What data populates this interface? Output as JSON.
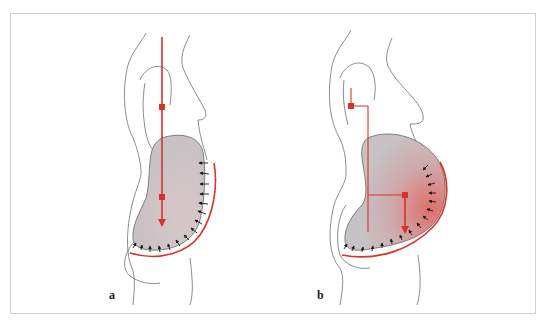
{
  "figure": {
    "panels": [
      {
        "id": "a",
        "label": "a",
        "description": "Side view of torso; vertical force line through center of mass; abdominal mass supported by red brace with inward pressure arrows"
      },
      {
        "id": "b",
        "label": "b",
        "description": "Side view of torso with anteriorly displaced abdominal mass (red-shaded); offset force line with lever arm; brace with inward pressure arrows"
      }
    ],
    "colors": {
      "force_line": "#d9322a",
      "brace": "#d9322a",
      "outline": "#6e6e6e",
      "mass_fill": "#c9c5c8",
      "mass_tint_b": "#d98a86",
      "arrows": "#1a1a1a",
      "frame": "#cfcfcf"
    },
    "icons": {
      "center_of_mass_marker": "red-square",
      "force_arrow": "red-down-arrow",
      "pressure_arrows": "black-inward-arrows"
    }
  }
}
